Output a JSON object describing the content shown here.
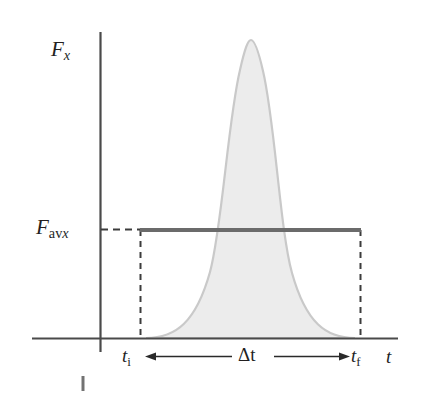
{
  "figure": {
    "type": "force-vs-time-impulse-diagram",
    "background_color": "#ffffff",
    "axes": {
      "y_axis": {
        "label_main": "F",
        "label_sub": "x",
        "x": 100,
        "y_top": 32,
        "y_bottom": 352,
        "color": "#4a4a4a"
      },
      "x_axis": {
        "label": "t",
        "y": 338,
        "x_left": 32,
        "x_right": 398,
        "color": "#4a4a4a"
      }
    },
    "labels": {
      "f_x": {
        "base": "F",
        "sub": "x"
      },
      "f_avx": {
        "base": "F",
        "sub_upright": "av",
        "sub_italic": "x"
      },
      "t_initial": {
        "base": "t",
        "sub": "i"
      },
      "t_final": {
        "base": "t",
        "sub": "f"
      },
      "delta_t": {
        "text": "Δt"
      },
      "t_axis": {
        "text": "t"
      }
    },
    "average_force_line": {
      "y": 230,
      "x_start": 140,
      "x_end": 361,
      "color": "#6b6b6b",
      "thickness": 4
    },
    "dashed_guides": {
      "color": "#3c3c3c",
      "horizontal_from_axis": {
        "y": 230,
        "x_start": 101,
        "x_end": 141
      },
      "vertical_left": {
        "x": 140,
        "y_top": 230,
        "y_bottom": 338
      },
      "vertical_right": {
        "x": 361,
        "y_top": 230,
        "y_bottom": 338
      }
    },
    "delta_t_arrow": {
      "y": 356,
      "x_start": 145,
      "x_end": 350,
      "color": "#2a2a2a",
      "double_headed": true
    },
    "curve": {
      "description": "bell-shaped force pulse",
      "fill_color": "#ececec",
      "stroke_color": "#c9c9c9",
      "peak_x": 251,
      "peak_y": 40,
      "base_y": 338,
      "base_x_left": 146,
      "base_x_right": 355
    },
    "artifact_mark": {
      "x": 83,
      "y_top": 376,
      "y_bottom": 391,
      "color": "#5a5a5a"
    }
  }
}
